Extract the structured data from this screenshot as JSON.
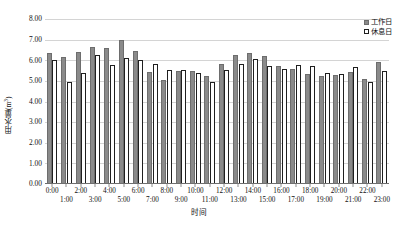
{
  "chart_data": {
    "type": "bar",
    "title": "",
    "xlabel": "时间",
    "ylabel": "用水量(m³)",
    "ylabel_base": "用水量(m",
    "ylabel_sup": "3",
    "ylabel_close": ")",
    "ylim": [
      0.0,
      8.0
    ],
    "ytick_labels": [
      "8.00",
      "7.00",
      "6.00",
      "5.00",
      "4.00",
      "3.00",
      "2.00",
      "1.00",
      "0.00"
    ],
    "ytick_values": [
      8.0,
      7.0,
      6.0,
      5.0,
      4.0,
      3.0,
      2.0,
      1.0,
      0.0
    ],
    "grid": true,
    "grid_axis": "y",
    "legend_position": "top-right",
    "categories": [
      "0:00",
      "1:00",
      "2:00",
      "3:00",
      "4:00",
      "5:00",
      "6:00",
      "7:00",
      "8:00",
      "9:00",
      "10:00",
      "11:00",
      "12:00",
      "13:00",
      "14:00",
      "15:00",
      "16:00",
      "17:00",
      "18:00",
      "19:00",
      "20:00",
      "21:00",
      "22:00",
      "23:00"
    ],
    "series": [
      {
        "name": "工作日",
        "color": "#8a8a8a",
        "style": "filled",
        "values": [
          6.35,
          6.15,
          6.4,
          6.65,
          6.6,
          7.0,
          6.45,
          5.45,
          5.05,
          5.5,
          5.5,
          5.25,
          5.8,
          6.25,
          6.35,
          6.2,
          5.7,
          5.6,
          5.35,
          5.25,
          5.3,
          5.45,
          5.1,
          5.9
        ]
      },
      {
        "name": "休息日",
        "color": "#ffffff",
        "style": "outlined",
        "values": [
          6.0,
          4.95,
          5.4,
          6.25,
          5.75,
          6.1,
          6.0,
          5.8,
          5.55,
          5.55,
          5.4,
          4.95,
          5.55,
          5.8,
          6.05,
          5.7,
          5.6,
          5.75,
          5.7,
          5.4,
          5.35,
          5.65,
          4.95,
          5.5
        ]
      }
    ]
  }
}
